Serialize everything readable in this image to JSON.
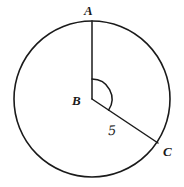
{
  "figure": {
    "kind": "circle-central-angle-diagram",
    "background_color": "#ffffff",
    "stroke_color": "#1a1a1a",
    "circle": {
      "center_label": "B",
      "center_x": 92,
      "center_y": 99,
      "radius": 78
    },
    "points": [
      {
        "id": "A",
        "label": "A",
        "x": 92,
        "y": 21,
        "description": "top of circle, endpoint of vertical radius"
      },
      {
        "id": "B",
        "label": "B",
        "x": 92,
        "y": 99,
        "description": "center of circle"
      },
      {
        "id": "C",
        "label": "C",
        "x": 158,
        "y": 143,
        "description": "lower right point on circle"
      }
    ],
    "segments": [
      {
        "id": "BA",
        "from": "B",
        "to": "A",
        "measure_label": ""
      },
      {
        "id": "BC",
        "from": "B",
        "to": "C",
        "measure_label": "5"
      }
    ],
    "angle_arc": {
      "vertex": "B",
      "from_ray": "BA",
      "to_ray": "BC",
      "radius": 20,
      "direction": "clockwise"
    },
    "labels": {
      "point_a": "A",
      "point_b": "B",
      "point_c": "C",
      "segment_bc_measure": "5"
    }
  }
}
